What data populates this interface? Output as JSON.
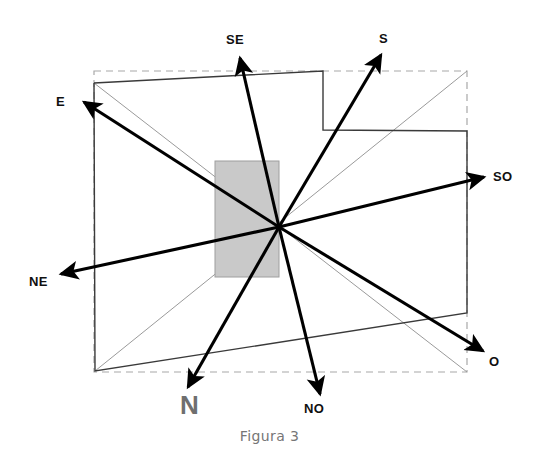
{
  "figure": {
    "caption": "Figura 3",
    "colors": {
      "background": "#ffffff",
      "outline": "#3a3a3a",
      "dashed_outline": "#a8a8a8",
      "thin_diagonal": "#9a9a9a",
      "shaded_rect_fill": "#c9c9c9",
      "shaded_rect_stroke": "#9e9e9e",
      "arrow": "#000000",
      "label_text": "#101010",
      "caption_text": "#767676",
      "north_label_text": "#6f6f6f"
    },
    "origin": {
      "x": 279,
      "y": 227,
      "name": "convergence-point"
    },
    "shaded_rectangle": {
      "x": 215,
      "y": 161,
      "width": 64,
      "height": 116
    },
    "dashed_bounds": {
      "x": 94,
      "y": 71,
      "width": 373,
      "height": 301
    },
    "outline_points": "94,83 323,71 323,130 467,131 467,313 95,371 94,83",
    "thin_diagonals": [
      {
        "from_x": 94,
        "from_y": 83,
        "to_x": 467,
        "to_y": 372
      },
      {
        "from_x": 95,
        "from_y": 371,
        "to_x": 467,
        "to_y": 71
      }
    ],
    "arrows": [
      {
        "id": "SE",
        "label": "SE",
        "tip_x": 240,
        "tip_y": 58,
        "label_x": 226,
        "label_y": 32,
        "label_style": "small"
      },
      {
        "id": "S",
        "label": "S",
        "tip_x": 381,
        "tip_y": 55,
        "label_x": 379,
        "label_y": 31,
        "label_style": "small"
      },
      {
        "id": "E",
        "label": "E",
        "tip_x": 84,
        "tip_y": 102,
        "label_x": 56,
        "label_y": 94,
        "label_style": "small"
      },
      {
        "id": "SO",
        "label": "SO",
        "tip_x": 484,
        "tip_y": 177,
        "label_x": 493,
        "label_y": 169,
        "label_style": "small"
      },
      {
        "id": "NE",
        "label": "NE",
        "tip_x": 61,
        "tip_y": 274,
        "label_x": 29,
        "label_y": 274,
        "label_style": "small"
      },
      {
        "id": "O",
        "label": "O",
        "tip_x": 483,
        "tip_y": 351,
        "label_x": 489,
        "label_y": 354,
        "label_style": "small"
      },
      {
        "id": "N",
        "label": "N",
        "tip_x": 188,
        "tip_y": 387,
        "label_x": 180,
        "label_y": 394,
        "label_style": "big-gray"
      },
      {
        "id": "NO",
        "label": "NO",
        "tip_x": 320,
        "tip_y": 394,
        "label_x": 304,
        "label_y": 401,
        "label_style": "small"
      }
    ]
  }
}
